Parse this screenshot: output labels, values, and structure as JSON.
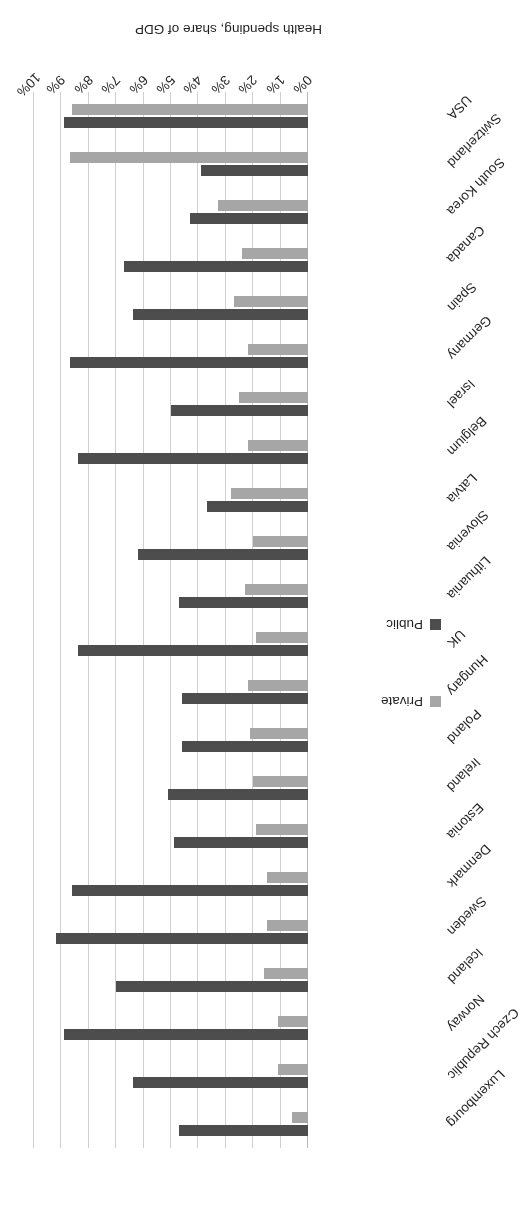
{
  "chart_data": {
    "type": "bar",
    "title": "",
    "orientation": "horizontal",
    "xlabel": "Health spending, share of GDP",
    "ylabel": "",
    "xlim": [
      0,
      10
    ],
    "xticks": [
      "0%",
      "1%",
      "2%",
      "3%",
      "4%",
      "5%",
      "6%",
      "7%",
      "8%",
      "9%",
      "10%"
    ],
    "xtick_values": [
      0,
      1,
      2,
      3,
      4,
      5,
      6,
      7,
      8,
      9,
      10
    ],
    "grid": true,
    "legend_position": "bottom-left",
    "categories": [
      "USA",
      "Switzerland",
      "South Korea",
      "Canada",
      "Spain",
      "Germany",
      "Israel",
      "Belgium",
      "Latvia",
      "Slovenia",
      "Lithuania",
      "UK",
      "Hungary",
      "Poland",
      "Ireland",
      "Estonia",
      "Denmark",
      "Sweden",
      "Iceland",
      "Norway",
      "Czech Republic",
      "Luxembourg"
    ],
    "series": [
      {
        "name": "Public",
        "color": "#4d4d4d",
        "values": [
          8.9,
          3.9,
          4.3,
          6.7,
          6.4,
          8.7,
          5.0,
          8.4,
          3.7,
          6.2,
          4.7,
          8.4,
          4.6,
          4.6,
          5.1,
          4.9,
          8.6,
          9.2,
          7.0,
          8.9,
          6.4,
          4.7
        ]
      },
      {
        "name": "Private",
        "color": "#a6a6a6",
        "values": [
          8.6,
          8.7,
          3.3,
          2.4,
          2.7,
          2.2,
          2.5,
          2.2,
          2.8,
          2.0,
          2.3,
          1.9,
          2.2,
          2.1,
          2.0,
          1.9,
          1.5,
          1.5,
          1.6,
          1.1,
          1.1,
          0.6
        ]
      }
    ]
  },
  "legend": {
    "entries": [
      {
        "label": "Private",
        "color": "#a6a6a6"
      },
      {
        "label": "Public",
        "color": "#4d4d4d"
      }
    ]
  },
  "axis": {
    "title": "Health spending, share of GDP"
  }
}
